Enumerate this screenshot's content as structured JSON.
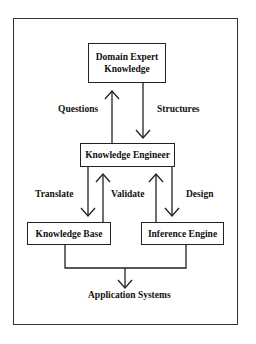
{
  "diagram": {
    "type": "flowchart",
    "nodes": {
      "domain_expert": "Domain Expert Knowledge",
      "domain_expert_line1": "Domain Expert",
      "domain_expert_line2": "Knowledge",
      "knowledge_engineer": "Knowledge Engineer",
      "knowledge_base": "Knowledge Base",
      "inference_engine": "Inference Engine",
      "application_systems": "Application Systems"
    },
    "edge_labels": {
      "questions": "Questions",
      "structures": "Structures",
      "translate": "Translate",
      "validate": "Validate",
      "design": "Design"
    },
    "edges": [
      {
        "from": "Knowledge Engineer",
        "to": "Domain Expert Knowledge",
        "label": "Questions"
      },
      {
        "from": "Domain Expert Knowledge",
        "to": "Knowledge Engineer",
        "label": "Structures"
      },
      {
        "from": "Knowledge Engineer",
        "to": "Knowledge Base",
        "label": "Translate"
      },
      {
        "from": "Knowledge Base",
        "to": "Knowledge Engineer",
        "label": "Validate"
      },
      {
        "from": "Inference Engine",
        "to": "Knowledge Engineer",
        "label": ""
      },
      {
        "from": "Knowledge Engineer",
        "to": "Inference Engine",
        "label": "Design"
      },
      {
        "from": "Knowledge Base",
        "to": "Application Systems",
        "label": ""
      },
      {
        "from": "Inference Engine",
        "to": "Application Systems",
        "label": ""
      }
    ]
  }
}
